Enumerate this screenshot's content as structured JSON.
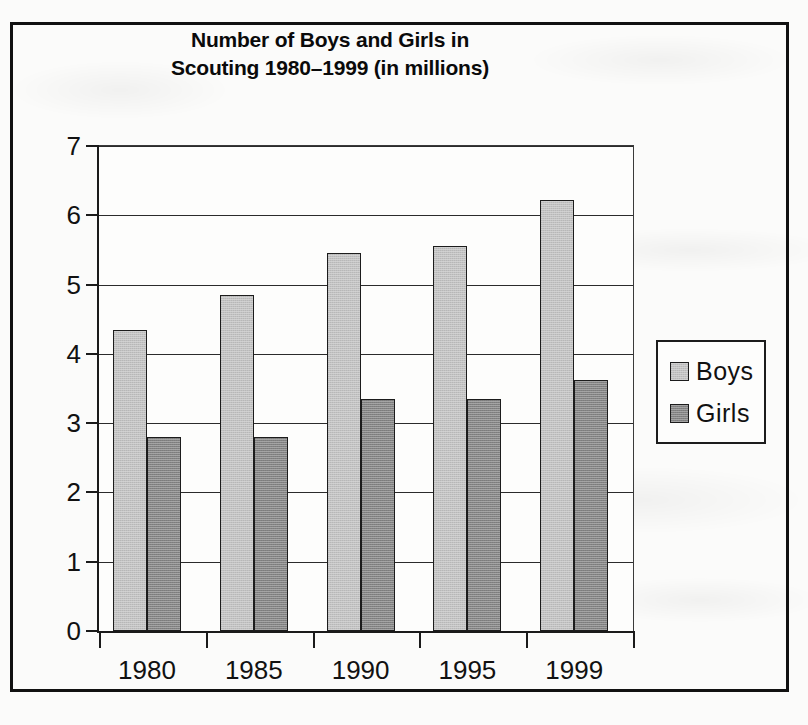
{
  "chart_data": {
    "type": "bar",
    "title": "Number of Boys and Girls in Scouting 1980–1999 (in millions)",
    "title_line1": "Number of Boys and Girls in",
    "title_line2": "Scouting 1980–1999 (in millions)",
    "xlabel": "",
    "ylabel": "",
    "categories": [
      "1980",
      "1985",
      "1990",
      "1995",
      "1999"
    ],
    "series": [
      {
        "name": "Boys",
        "color": "#c2c2c2",
        "values": [
          4.35,
          4.85,
          5.45,
          5.55,
          6.22
        ]
      },
      {
        "name": "Girls",
        "color": "#838383",
        "values": [
          2.8,
          2.8,
          3.35,
          3.35,
          3.62
        ]
      }
    ],
    "ylim": [
      0,
      7
    ],
    "ytick_labels": [
      "0",
      "1",
      "2",
      "3",
      "4",
      "5",
      "6",
      "7"
    ],
    "ytick_values": [
      0,
      1,
      2,
      3,
      4,
      5,
      6,
      7
    ],
    "grid": true,
    "grid_axis": "y",
    "legend_position": "right",
    "legend_entries": [
      "Boys",
      "Girls"
    ]
  },
  "frame": {
    "border_color": "#111111",
    "background_color": "#fbfbfa"
  }
}
